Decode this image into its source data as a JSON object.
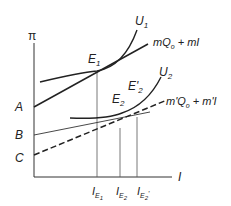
{
  "diagram": {
    "axis_labels": {
      "y": "π",
      "x": "I"
    },
    "intercepts": [
      "A",
      "B",
      "C"
    ],
    "curves": [
      {
        "id": "U1",
        "base": "U",
        "sub": "1"
      },
      {
        "id": "U2",
        "base": "U",
        "sub": "2"
      }
    ],
    "lines": [
      {
        "id": "line1",
        "label_parts": [
          "mQ",
          "o",
          " + mI"
        ],
        "style": "solid-thick"
      },
      {
        "id": "line2",
        "label_parts": [
          "m'Q",
          "o",
          " + m'I"
        ],
        "style": "solid-thin"
      },
      {
        "id": "line3",
        "label_parts": [],
        "style": "dashed"
      }
    ],
    "points": [
      {
        "id": "E1",
        "base": "E",
        "sub": "1"
      },
      {
        "id": "E2",
        "base": "E",
        "sub": "2"
      },
      {
        "id": "E2p",
        "base": "E'",
        "sub": "2"
      }
    ],
    "x_ticks": [
      {
        "base": "I",
        "sub": "E",
        "subsub": "1",
        "prime": ""
      },
      {
        "base": "I",
        "sub": "E",
        "subsub": "2",
        "prime": ""
      },
      {
        "base": "I",
        "sub": "E",
        "subsub": "2",
        "prime": "'"
      }
    ]
  }
}
